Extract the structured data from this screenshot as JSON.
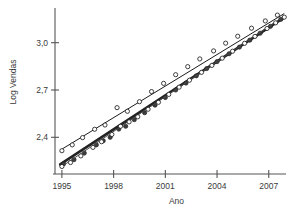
{
  "figure": {
    "background_color": "#ffffff",
    "line_color_upper": "#1b1b1b",
    "line_color_lower_thick": "#232323",
    "line_color_lower_thin": "#4a4a4a"
  },
  "chart_data": {
    "type": "scatter",
    "title": "",
    "subtitle": "",
    "xlabel": "Ano",
    "ylabel": "Log Vendas",
    "xlim": [
      1994.6,
      2008.0
    ],
    "ylim": [
      2.18,
      3.22
    ],
    "xticks": [
      1995,
      1998,
      2001,
      2004,
      2007
    ],
    "xtick_labels": [
      "1995",
      "1998",
      "2001",
      "2004",
      "2007"
    ],
    "yticks": [
      2.4,
      2.7,
      3.0
    ],
    "ytick_labels": [
      "2,4",
      "2,7",
      "3,0"
    ],
    "grid": false,
    "legend": "none",
    "annotations": [],
    "series": [
      {
        "name": "serie-superior",
        "marker": "open-circle",
        "fit_line": {
          "x": [
            1994.9,
            2007.9
          ],
          "y": [
            2.318,
            3.185
          ],
          "style": "thin"
        },
        "points": [
          {
            "x": 1995.0,
            "y": 2.315
          },
          {
            "x": 1995.6,
            "y": 2.352
          },
          {
            "x": 1996.2,
            "y": 2.398
          },
          {
            "x": 1996.9,
            "y": 2.451
          },
          {
            "x": 1997.5,
            "y": 2.478
          },
          {
            "x": 1998.2,
            "y": 2.588
          },
          {
            "x": 1998.8,
            "y": 2.565
          },
          {
            "x": 1999.5,
            "y": 2.626
          },
          {
            "x": 2000.2,
            "y": 2.69
          },
          {
            "x": 2000.9,
            "y": 2.742
          },
          {
            "x": 2001.6,
            "y": 2.797
          },
          {
            "x": 2002.3,
            "y": 2.848
          },
          {
            "x": 2003.0,
            "y": 2.897
          },
          {
            "x": 2003.8,
            "y": 2.948
          },
          {
            "x": 2004.5,
            "y": 2.997
          },
          {
            "x": 2005.2,
            "y": 3.041
          },
          {
            "x": 2006.0,
            "y": 3.092
          },
          {
            "x": 2006.8,
            "y": 3.138
          },
          {
            "x": 2007.5,
            "y": 3.175
          }
        ]
      },
      {
        "name": "serie-inferior-ajustada",
        "marker": "dark-circle",
        "fit_line": {
          "x": [
            1994.9,
            2007.9
          ],
          "y": [
            2.228,
            3.16
          ],
          "style": "thick"
        },
        "points": [
          {
            "x": 1995.1,
            "y": 2.232
          },
          {
            "x": 1995.7,
            "y": 2.258
          },
          {
            "x": 1996.3,
            "y": 2.3
          },
          {
            "x": 1997.0,
            "y": 2.352
          },
          {
            "x": 1997.4,
            "y": 2.378
          },
          {
            "x": 1997.8,
            "y": 2.4
          },
          {
            "x": 1998.3,
            "y": 2.452
          },
          {
            "x": 1998.7,
            "y": 2.47
          },
          {
            "x": 1999.2,
            "y": 2.512
          },
          {
            "x": 1999.8,
            "y": 2.556
          },
          {
            "x": 2000.4,
            "y": 2.604
          },
          {
            "x": 2001.0,
            "y": 2.652
          },
          {
            "x": 2001.6,
            "y": 2.7
          },
          {
            "x": 2002.2,
            "y": 2.744
          },
          {
            "x": 2002.8,
            "y": 2.79
          },
          {
            "x": 2003.4,
            "y": 2.836
          },
          {
            "x": 2004.0,
            "y": 2.88
          },
          {
            "x": 2004.7,
            "y": 2.93
          },
          {
            "x": 2005.3,
            "y": 2.972
          },
          {
            "x": 2005.9,
            "y": 3.016
          },
          {
            "x": 2006.5,
            "y": 3.06
          },
          {
            "x": 2007.1,
            "y": 3.104
          },
          {
            "x": 2007.7,
            "y": 3.148
          }
        ]
      },
      {
        "name": "serie-inferior-observada",
        "marker": "open-circle",
        "fit_line": {
          "x": [
            1994.9,
            2007.9
          ],
          "y": [
            2.208,
            3.168
          ],
          "style": "mid"
        },
        "points": [
          {
            "x": 1995.0,
            "y": 2.215
          },
          {
            "x": 1995.5,
            "y": 2.24
          },
          {
            "x": 1996.1,
            "y": 2.282
          },
          {
            "x": 1996.8,
            "y": 2.336
          },
          {
            "x": 1997.3,
            "y": 2.372
          },
          {
            "x": 1997.9,
            "y": 2.418
          },
          {
            "x": 1998.4,
            "y": 2.47
          },
          {
            "x": 1998.9,
            "y": 2.498
          },
          {
            "x": 1999.4,
            "y": 2.53
          },
          {
            "x": 2000.0,
            "y": 2.578
          },
          {
            "x": 2000.6,
            "y": 2.622
          },
          {
            "x": 2001.2,
            "y": 2.672
          },
          {
            "x": 2001.8,
            "y": 2.718
          },
          {
            "x": 2002.4,
            "y": 2.762
          },
          {
            "x": 2003.1,
            "y": 2.812
          },
          {
            "x": 2003.7,
            "y": 2.856
          },
          {
            "x": 2004.3,
            "y": 2.902
          },
          {
            "x": 2004.9,
            "y": 2.946
          },
          {
            "x": 2005.6,
            "y": 2.996
          },
          {
            "x": 2006.2,
            "y": 3.04
          },
          {
            "x": 2006.9,
            "y": 3.09
          },
          {
            "x": 2007.4,
            "y": 3.126
          },
          {
            "x": 2007.9,
            "y": 3.162
          }
        ]
      }
    ]
  }
}
